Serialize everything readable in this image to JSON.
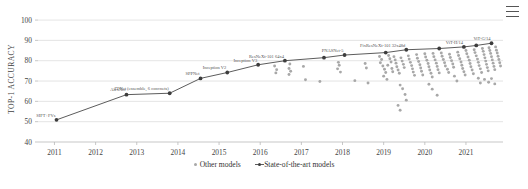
{
  "chart_data": {
    "type": "scatter",
    "title": "",
    "xlabel": "",
    "ylabel": "TOP-1 ACCURACY",
    "xlim": [
      2010.6,
      2021.9
    ],
    "ylim": [
      40,
      102
    ],
    "grid": true,
    "xticks": [
      "2011",
      "2012",
      "2013",
      "2014",
      "2015",
      "2016",
      "2017",
      "2018",
      "2019",
      "2020",
      "2021"
    ],
    "yticks": [
      "40",
      "50",
      "60",
      "70",
      "80",
      "90",
      "100"
    ],
    "legend_position": "bottom-center",
    "series": [
      {
        "name": "State-of-the-art models",
        "type": "line",
        "color": "#5c5c5c",
        "points": [
          {
            "x": 2011.05,
            "y": 50.9,
            "label": "SIFT+FVs"
          },
          {
            "x": 2012.75,
            "y": 63.3,
            "label": "AlexNet"
          },
          {
            "x": 2013.8,
            "y": 64.0,
            "label": "ZFNet (ensemble, 6 convnets)"
          },
          {
            "x": 2014.55,
            "y": 71.3,
            "label": "SPPNet"
          },
          {
            "x": 2015.2,
            "y": 74.2,
            "label": "Inception V2"
          },
          {
            "x": 2015.95,
            "y": 78.0,
            "label": "Inception V3"
          },
          {
            "x": 2016.6,
            "y": 80.0,
            "label": "ResNeXt-101 64x4"
          },
          {
            "x": 2017.55,
            "y": 81.5,
            "label": ""
          },
          {
            "x": 2018.05,
            "y": 82.8,
            "label": "PNASNet-5"
          },
          {
            "x": 2019.05,
            "y": 84.0,
            "label": ""
          },
          {
            "x": 2019.55,
            "y": 85.4,
            "label": "FixResNeXt-101 32x48d"
          },
          {
            "x": 2020.35,
            "y": 86.0,
            "label": ""
          },
          {
            "x": 2020.95,
            "y": 86.8,
            "label": "ViT-H/14"
          },
          {
            "x": 2021.25,
            "y": 87.5,
            "label": ""
          },
          {
            "x": 2021.62,
            "y": 88.6,
            "label": "ViT-G/14"
          }
        ]
      },
      {
        "name": "Other models",
        "type": "scatter",
        "color": "#a8a8a8",
        "points": [
          {
            "x": 2016.35,
            "y": 77.4
          },
          {
            "x": 2016.4,
            "y": 75.6
          },
          {
            "x": 2016.38,
            "y": 74.0
          },
          {
            "x": 2016.72,
            "y": 78.4
          },
          {
            "x": 2016.7,
            "y": 76.2
          },
          {
            "x": 2016.74,
            "y": 74.8
          },
          {
            "x": 2016.7,
            "y": 73.2
          },
          {
            "x": 2017.05,
            "y": 77.2
          },
          {
            "x": 2017.1,
            "y": 70.6
          },
          {
            "x": 2017.45,
            "y": 69.8
          },
          {
            "x": 2017.9,
            "y": 79.2
          },
          {
            "x": 2017.92,
            "y": 77.8
          },
          {
            "x": 2017.88,
            "y": 76.0
          },
          {
            "x": 2017.95,
            "y": 74.4
          },
          {
            "x": 2018.55,
            "y": 78.6
          },
          {
            "x": 2018.58,
            "y": 76.4
          },
          {
            "x": 2018.3,
            "y": 70.2
          },
          {
            "x": 2018.62,
            "y": 69.0
          },
          {
            "x": 2018.9,
            "y": 82.1
          },
          {
            "x": 2018.95,
            "y": 80.6
          },
          {
            "x": 2018.92,
            "y": 79.0
          },
          {
            "x": 2018.98,
            "y": 77.4
          },
          {
            "x": 2019.02,
            "y": 75.8
          },
          {
            "x": 2019.05,
            "y": 74.2
          },
          {
            "x": 2019.0,
            "y": 72.4
          },
          {
            "x": 2019.08,
            "y": 70.8
          },
          {
            "x": 2019.12,
            "y": 82.6
          },
          {
            "x": 2019.15,
            "y": 81.0
          },
          {
            "x": 2019.18,
            "y": 79.4
          },
          {
            "x": 2019.1,
            "y": 77.8
          },
          {
            "x": 2019.2,
            "y": 76.2
          },
          {
            "x": 2019.22,
            "y": 74.6
          },
          {
            "x": 2019.25,
            "y": 82.0
          },
          {
            "x": 2019.28,
            "y": 80.4
          },
          {
            "x": 2019.3,
            "y": 78.8
          },
          {
            "x": 2019.32,
            "y": 77.0
          },
          {
            "x": 2019.35,
            "y": 75.4
          },
          {
            "x": 2019.38,
            "y": 73.8
          },
          {
            "x": 2019.42,
            "y": 81.4
          },
          {
            "x": 2019.45,
            "y": 79.8
          },
          {
            "x": 2019.48,
            "y": 78.2
          },
          {
            "x": 2019.5,
            "y": 76.6
          },
          {
            "x": 2019.4,
            "y": 68.0
          },
          {
            "x": 2019.46,
            "y": 66.2
          },
          {
            "x": 2019.52,
            "y": 63.4
          },
          {
            "x": 2019.55,
            "y": 60.6
          },
          {
            "x": 2019.6,
            "y": 82.4
          },
          {
            "x": 2019.62,
            "y": 80.8
          },
          {
            "x": 2019.65,
            "y": 79.2
          },
          {
            "x": 2019.68,
            "y": 77.6
          },
          {
            "x": 2019.7,
            "y": 76.0
          },
          {
            "x": 2019.72,
            "y": 74.4
          },
          {
            "x": 2019.75,
            "y": 72.8
          },
          {
            "x": 2019.8,
            "y": 83.0
          },
          {
            "x": 2019.82,
            "y": 81.2
          },
          {
            "x": 2019.85,
            "y": 79.6
          },
          {
            "x": 2019.88,
            "y": 78.0
          },
          {
            "x": 2019.9,
            "y": 76.4
          },
          {
            "x": 2019.92,
            "y": 74.8
          },
          {
            "x": 2019.95,
            "y": 73.0
          },
          {
            "x": 2020.0,
            "y": 83.4
          },
          {
            "x": 2020.02,
            "y": 81.8
          },
          {
            "x": 2020.05,
            "y": 80.2
          },
          {
            "x": 2020.08,
            "y": 78.6
          },
          {
            "x": 2020.1,
            "y": 77.0
          },
          {
            "x": 2020.12,
            "y": 75.4
          },
          {
            "x": 2020.15,
            "y": 73.8
          },
          {
            "x": 2020.18,
            "y": 72.0
          },
          {
            "x": 2020.2,
            "y": 83.6
          },
          {
            "x": 2020.22,
            "y": 82.0
          },
          {
            "x": 2020.25,
            "y": 80.4
          },
          {
            "x": 2020.28,
            "y": 78.8
          },
          {
            "x": 2020.3,
            "y": 77.2
          },
          {
            "x": 2020.32,
            "y": 75.6
          },
          {
            "x": 2020.35,
            "y": 74.0
          },
          {
            "x": 2020.1,
            "y": 68.4
          },
          {
            "x": 2020.18,
            "y": 66.0
          },
          {
            "x": 2020.4,
            "y": 83.8
          },
          {
            "x": 2020.42,
            "y": 82.2
          },
          {
            "x": 2020.45,
            "y": 80.6
          },
          {
            "x": 2020.48,
            "y": 79.0
          },
          {
            "x": 2020.5,
            "y": 77.4
          },
          {
            "x": 2020.55,
            "y": 75.8
          },
          {
            "x": 2020.58,
            "y": 74.2
          },
          {
            "x": 2020.6,
            "y": 83.2
          },
          {
            "x": 2020.62,
            "y": 81.6
          },
          {
            "x": 2020.65,
            "y": 80.0
          },
          {
            "x": 2020.68,
            "y": 78.4
          },
          {
            "x": 2020.7,
            "y": 76.8
          },
          {
            "x": 2020.72,
            "y": 72.4
          },
          {
            "x": 2020.8,
            "y": 84.2
          },
          {
            "x": 2020.82,
            "y": 82.6
          },
          {
            "x": 2020.85,
            "y": 81.0
          },
          {
            "x": 2020.88,
            "y": 79.4
          },
          {
            "x": 2020.9,
            "y": 77.8
          },
          {
            "x": 2020.92,
            "y": 76.2
          },
          {
            "x": 2020.95,
            "y": 74.6
          },
          {
            "x": 2020.98,
            "y": 73.0
          },
          {
            "x": 2021.0,
            "y": 85.0
          },
          {
            "x": 2021.02,
            "y": 83.4
          },
          {
            "x": 2021.05,
            "y": 81.8
          },
          {
            "x": 2021.08,
            "y": 80.2
          },
          {
            "x": 2021.1,
            "y": 78.6
          },
          {
            "x": 2021.12,
            "y": 77.0
          },
          {
            "x": 2021.15,
            "y": 75.4
          },
          {
            "x": 2021.18,
            "y": 73.6
          },
          {
            "x": 2021.2,
            "y": 85.4
          },
          {
            "x": 2021.22,
            "y": 84.0
          },
          {
            "x": 2021.25,
            "y": 82.4
          },
          {
            "x": 2021.28,
            "y": 80.8
          },
          {
            "x": 2021.3,
            "y": 79.2
          },
          {
            "x": 2021.32,
            "y": 77.6
          },
          {
            "x": 2021.35,
            "y": 76.0
          },
          {
            "x": 2021.38,
            "y": 74.2
          },
          {
            "x": 2021.4,
            "y": 86.0
          },
          {
            "x": 2021.42,
            "y": 84.6
          },
          {
            "x": 2021.44,
            "y": 83.0
          },
          {
            "x": 2021.46,
            "y": 81.4
          },
          {
            "x": 2021.48,
            "y": 79.8
          },
          {
            "x": 2021.5,
            "y": 78.2
          },
          {
            "x": 2021.52,
            "y": 76.6
          },
          {
            "x": 2021.54,
            "y": 75.0
          },
          {
            "x": 2021.56,
            "y": 86.4
          },
          {
            "x": 2021.58,
            "y": 85.0
          },
          {
            "x": 2021.6,
            "y": 83.6
          },
          {
            "x": 2021.62,
            "y": 82.0
          },
          {
            "x": 2021.64,
            "y": 80.4
          },
          {
            "x": 2021.66,
            "y": 78.8
          },
          {
            "x": 2021.68,
            "y": 77.2
          },
          {
            "x": 2021.7,
            "y": 75.6
          },
          {
            "x": 2021.72,
            "y": 86.8
          },
          {
            "x": 2021.74,
            "y": 85.2
          },
          {
            "x": 2021.76,
            "y": 83.8
          },
          {
            "x": 2021.78,
            "y": 82.2
          },
          {
            "x": 2021.8,
            "y": 80.6
          },
          {
            "x": 2021.82,
            "y": 79.0
          },
          {
            "x": 2021.84,
            "y": 77.4
          },
          {
            "x": 2021.45,
            "y": 70.8
          },
          {
            "x": 2021.55,
            "y": 69.4
          },
          {
            "x": 2021.62,
            "y": 71.2
          },
          {
            "x": 2021.7,
            "y": 68.6
          },
          {
            "x": 2021.3,
            "y": 71.4
          },
          {
            "x": 2021.35,
            "y": 69.0
          },
          {
            "x": 2020.78,
            "y": 70.0
          },
          {
            "x": 2020.3,
            "y": 63.0
          },
          {
            "x": 2019.35,
            "y": 58.0
          },
          {
            "x": 2019.4,
            "y": 55.6
          }
        ]
      }
    ]
  },
  "legend": {
    "other_label": "Other models",
    "sota_label": "State-of-the-art models"
  },
  "caption": {
    "text": ""
  },
  "toolbar": {
    "menu_label": "menu"
  }
}
